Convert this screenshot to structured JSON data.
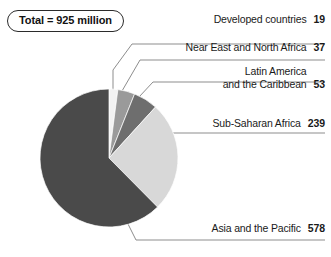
{
  "badge": {
    "label": "Total = 925 million"
  },
  "chart_data": {
    "type": "pie",
    "title": "",
    "subtitle": "",
    "total": 925,
    "total_label": "Total = 925 million",
    "units": "million",
    "legend_position": "callout-right",
    "grid": false,
    "categories": [
      "Developed countries",
      "Near East and North Africa",
      "Latin America and the Caribbean",
      "Sub-Saharan Africa",
      "Asia and the Pacific"
    ],
    "values": [
      19,
      37,
      53,
      239,
      578
    ],
    "colors": [
      "#f2f2f2",
      "#9a9a9a",
      "#6e6e6e",
      "#d8d8d8",
      "#4a4a4a"
    ],
    "slices": [
      {
        "label": "Developed countries",
        "label_line1": "Developed countries",
        "label_line2": "",
        "value": "19",
        "value_num": 19,
        "percent": 2.1,
        "color": "#f2f2f2"
      },
      {
        "label": "Near East and North Africa",
        "label_line1": "Near East and North Africa",
        "label_line2": "",
        "value": "37",
        "value_num": 37,
        "percent": 4.0,
        "color": "#9a9a9a"
      },
      {
        "label": "Latin America and the Caribbean",
        "label_line1": "Latin America",
        "label_line2": "and the Caribbean",
        "value": "53",
        "value_num": 53,
        "percent": 5.7,
        "color": "#6e6e6e"
      },
      {
        "label": "Sub-Saharan Africa",
        "label_line1": "Sub-Saharan Africa",
        "label_line2": "",
        "value": "239",
        "value_num": 239,
        "percent": 25.8,
        "color": "#d8d8d8"
      },
      {
        "label": "Asia and the Pacific",
        "label_line1": "Asia and the Pacific",
        "label_line2": "",
        "value": "578",
        "value_num": 578,
        "percent": 62.5,
        "color": "#4a4a4a"
      }
    ]
  }
}
